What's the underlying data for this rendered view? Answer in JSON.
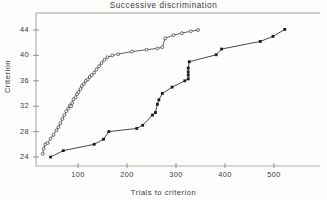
{
  "chart_data": {
    "type": "line",
    "title": "Successive  discrimination",
    "xlabel": "Trials  to  criterion",
    "ylabel": "Criterion",
    "xlim": [
      0,
      580
    ],
    "ylim": [
      22.5,
      45.5
    ],
    "xticks": [
      100,
      200,
      300,
      400,
      500
    ],
    "xtick_labels": [
      "100",
      "200",
      "300",
      "400",
      "500"
    ],
    "yticks": [
      24,
      28,
      32,
      36,
      40,
      44
    ],
    "ytick_labels": [
      "24",
      "28",
      "32",
      "36",
      "40",
      "44"
    ],
    "grid": false,
    "legend": "none",
    "series": [
      {
        "name": "open-circle-series",
        "marker": "open-circle",
        "color": "#333333",
        "points": [
          [
            28,
            24.5
          ],
          [
            30,
            25.3
          ],
          [
            33,
            26.0
          ],
          [
            38,
            26.2
          ],
          [
            44,
            26.9
          ],
          [
            50,
            27.5
          ],
          [
            56,
            28.2
          ],
          [
            60,
            28.7
          ],
          [
            64,
            29.3
          ],
          [
            68,
            30.0
          ],
          [
            72,
            30.6
          ],
          [
            76,
            31.2
          ],
          [
            80,
            31.6
          ],
          [
            83,
            32.1
          ],
          [
            86,
            32.0
          ],
          [
            88,
            32.5
          ],
          [
            91,
            33.1
          ],
          [
            95,
            33.4
          ],
          [
            98,
            33.9
          ],
          [
            101,
            34.2
          ],
          [
            105,
            34.7
          ],
          [
            108,
            35.2
          ],
          [
            112,
            35.5
          ],
          [
            116,
            36.0
          ],
          [
            120,
            36.2
          ],
          [
            124,
            36.6
          ],
          [
            128,
            36.9
          ],
          [
            133,
            37.3
          ],
          [
            138,
            37.8
          ],
          [
            143,
            38.3
          ],
          [
            148,
            38.8
          ],
          [
            154,
            39.3
          ],
          [
            160,
            39.7
          ],
          [
            170,
            40.0
          ],
          [
            182,
            40.2
          ],
          [
            210,
            40.6
          ],
          [
            240,
            40.9
          ],
          [
            262,
            41.1
          ],
          [
            272,
            41.3
          ],
          [
            278,
            42.7
          ],
          [
            295,
            43.2
          ],
          [
            312,
            43.5
          ],
          [
            330,
            43.8
          ],
          [
            345,
            44.0
          ]
        ]
      },
      {
        "name": "filled-square-series",
        "marker": "filled-square",
        "color": "#1a1a1a",
        "points": [
          [
            44,
            24.0
          ],
          [
            70,
            25.0
          ],
          [
            133,
            26.0
          ],
          [
            152,
            26.8
          ],
          [
            163,
            28.0
          ],
          [
            220,
            28.5
          ],
          [
            232,
            29.0
          ],
          [
            252,
            30.6
          ],
          [
            258,
            31.0
          ],
          [
            262,
            32.3
          ],
          [
            265,
            33.0
          ],
          [
            272,
            34.0
          ],
          [
            292,
            35.0
          ],
          [
            318,
            36.0
          ],
          [
            325,
            36.3
          ],
          [
            325,
            36.9
          ],
          [
            325,
            37.4
          ],
          [
            325,
            38.0
          ],
          [
            327,
            39.0
          ],
          [
            382,
            40.1
          ],
          [
            393,
            41.0
          ],
          [
            472,
            42.2
          ],
          [
            498,
            43.0
          ],
          [
            522,
            44.1
          ]
        ]
      }
    ]
  },
  "axes": {
    "frame": "top-and-left-rule",
    "tick_direction": "out"
  }
}
